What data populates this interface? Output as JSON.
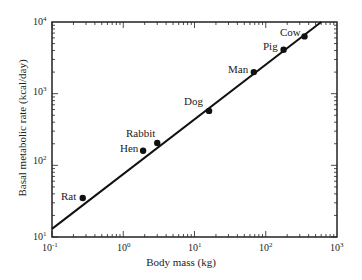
{
  "chart_data": {
    "type": "scatter",
    "title": "",
    "xlabel": "Body mass (kg)",
    "ylabel": "Basal metabolic rate (kcal/day)",
    "xscale": "log",
    "yscale": "log",
    "xlim": [
      0.1,
      1000
    ],
    "ylim": [
      10,
      10000
    ],
    "x_ticks": [
      "10^-1",
      "10^0",
      "10^1",
      "10^2",
      "10^3"
    ],
    "y_ticks": [
      "10^1",
      "10^2",
      "10^3",
      "10^4"
    ],
    "grid": false,
    "legend": null,
    "points": [
      {
        "label": "Rat",
        "x": 0.27,
        "y": 35
      },
      {
        "label": "Hen",
        "x": 1.9,
        "y": 160
      },
      {
        "label": "Rabbit",
        "x": 3.0,
        "y": 205
      },
      {
        "label": "Dog",
        "x": 16,
        "y": 575
      },
      {
        "label": "Man",
        "x": 68,
        "y": 2000
      },
      {
        "label": "Pig",
        "x": 178,
        "y": 4100
      },
      {
        "label": "Cow",
        "x": 350,
        "y": 6300
      }
    ],
    "fit_line": {
      "description": "power-law fit",
      "x_start": 0.1,
      "y_start": 13,
      "x_end": 600,
      "y_end": 10000
    }
  },
  "axes": {
    "xlabel": "Body mass (kg)",
    "ylabel": "Basal metabolic rate (kcal/day)",
    "x_tick_base": [
      "10",
      "10",
      "10",
      "10",
      "10"
    ],
    "x_tick_exp": [
      "-1",
      "0",
      "1",
      "2",
      "3"
    ],
    "y_tick_base": [
      "10",
      "10",
      "10",
      "10"
    ],
    "y_tick_exp": [
      "1",
      "2",
      "3",
      "4"
    ]
  },
  "labels": {
    "rat": "Rat",
    "hen": "Hen",
    "rabbit": "Rabbit",
    "dog": "Dog",
    "man": "Man",
    "pig": "Pig",
    "cow": "Cow"
  }
}
